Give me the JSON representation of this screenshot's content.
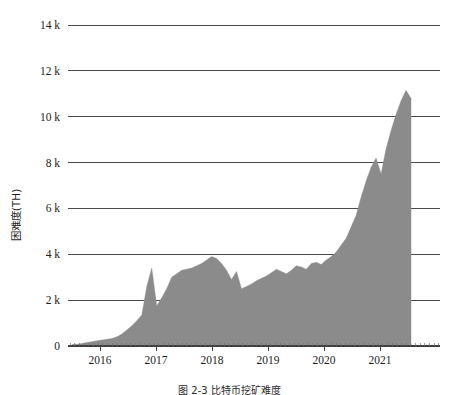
{
  "figure": {
    "caption": "图 2-3  比特币挖矿难度"
  },
  "chart_data": {
    "type": "area",
    "title": "",
    "subtitle": "",
    "xlabel": "",
    "ylabel": "困难度(TH)",
    "ylim": [
      0,
      14000
    ],
    "xlim": [
      "2015-09",
      "2021-09"
    ],
    "grid": true,
    "legend": null,
    "annotations": [],
    "y_ticks": [
      0,
      2000,
      4000,
      6000,
      8000,
      10000,
      12000,
      14000
    ],
    "y_tick_labels": [
      "0",
      "2 k",
      "4 k",
      "6 k",
      "8 k",
      "10 k",
      "12 k",
      "14 k"
    ],
    "x_ticks": [
      "2016",
      "2017",
      "2018",
      "2019",
      "2020",
      "2021"
    ],
    "x_tick_labels": [
      "2016",
      "2017",
      "2018",
      "2019",
      "2020",
      "2021"
    ],
    "series": [
      {
        "name": "difficulty",
        "color": "#8b8b8b",
        "x": [
          "2015-09",
          "2015-11",
          "2016-01",
          "2016-03",
          "2016-05",
          "2016-07",
          "2016-09",
          "2016-11",
          "2017-01",
          "2017-03",
          "2017-05",
          "2017-07",
          "2017-08",
          "2017-09",
          "2017-10",
          "2017-11",
          "2017-11.5",
          "2017-12",
          "2018-01",
          "2018-01.5",
          "2018-02",
          "2018-02.5",
          "2018-03",
          "2018-04",
          "2018-05",
          "2018-06",
          "2018-07",
          "2018-08",
          "2018-09",
          "2018-10",
          "2018-11",
          "2018-11.5",
          "2018-12",
          "2018-12.5",
          "2019-01",
          "2019-02",
          "2019-03",
          "2019-04",
          "2019-05",
          "2019-06",
          "2019-07",
          "2019-08",
          "2019-09",
          "2019-10",
          "2019-11",
          "2019-12",
          "2020-01",
          "2020-02",
          "2020-03",
          "2020-04",
          "2020-05",
          "2020-06",
          "2020-07",
          "2020-08",
          "2020-09",
          "2020-10",
          "2020-11",
          "2020-12",
          "2021-01",
          "2021-02",
          "2021-03",
          "2021-04",
          "2021-04.5",
          "2021-05",
          "2021-05.5",
          "2021-06",
          "2021-06.5",
          "2021-07",
          "2021-07.5"
        ],
        "values": [
          60,
          80,
          110,
          150,
          190,
          230,
          260,
          290,
          330,
          400,
          520,
          700,
          880,
          1100,
          1350,
          2600,
          3400,
          1750,
          2100,
          2500,
          3000,
          3150,
          3300,
          3350,
          3400,
          3500,
          3600,
          3750,
          3900,
          3820,
          3600,
          3300,
          2900,
          3250,
          2500,
          2600,
          2700,
          2850,
          2950,
          3050,
          3200,
          3350,
          3250,
          3150,
          3300,
          3500,
          3450,
          3350,
          3600,
          3650,
          3550,
          3750,
          3900,
          4100,
          4400,
          4700,
          5200,
          5700,
          6500,
          7200,
          7800,
          8200,
          7500,
          8600,
          9400,
          10100,
          10700,
          11150,
          10800
        ]
      }
    ]
  }
}
